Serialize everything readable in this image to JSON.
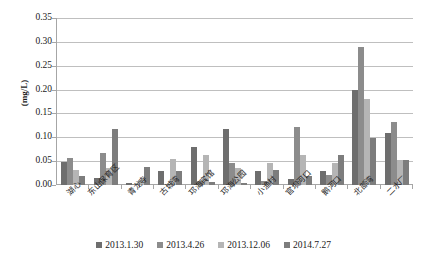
{
  "chart_data": {
    "type": "bar",
    "title": "",
    "xlabel": "",
    "ylabel": "(mg/L)",
    "ylim": [
      0,
      0.35
    ],
    "ytick_labels": [
      "0.35",
      "0.30",
      "0.25",
      "0.20",
      "0.15",
      "0.10",
      "0.05",
      "0.00"
    ],
    "ytick_values": [
      0.35,
      0.3,
      0.25,
      0.2,
      0.15,
      0.1,
      0.05,
      0.0
    ],
    "grid": true,
    "legend_position": "bottom",
    "categories": [
      "湖心",
      "东山保育区",
      "青龙寺",
      "古城湾",
      "邛海宾馆",
      "邛海公园",
      "小渔村",
      "官坝河口",
      "鹅河口",
      "北部湾",
      "二水厂"
    ],
    "series": [
      {
        "name": "2013.1.30",
        "color": "#6e6e6e",
        "values": [
          0.048,
          0.014,
          0.005,
          0.029,
          0.08,
          0.118,
          0.029,
          0.013,
          0.03,
          0.199,
          0.11
        ]
      },
      {
        "name": "2013.4.26",
        "color": "#8c8c8c",
        "values": [
          0.057,
          0.067,
          0.002,
          0.003,
          0.009,
          0.046,
          0.008,
          0.122,
          0.02,
          0.29,
          0.133
        ]
      },
      {
        "name": "2013.12.06",
        "color": "#b5b5b5",
        "values": [
          0.032,
          0.036,
          0.01,
          0.054,
          0.063,
          0.036,
          0.046,
          0.062,
          0.047,
          0.18,
          0.052
        ]
      },
      {
        "name": "2014.7.27",
        "color": "#7d7d7d",
        "values": [
          0.018,
          0.118,
          0.038,
          0.03,
          0.007,
          0.005,
          0.031,
          0.018,
          0.063,
          0.098,
          0.053
        ]
      }
    ]
  }
}
